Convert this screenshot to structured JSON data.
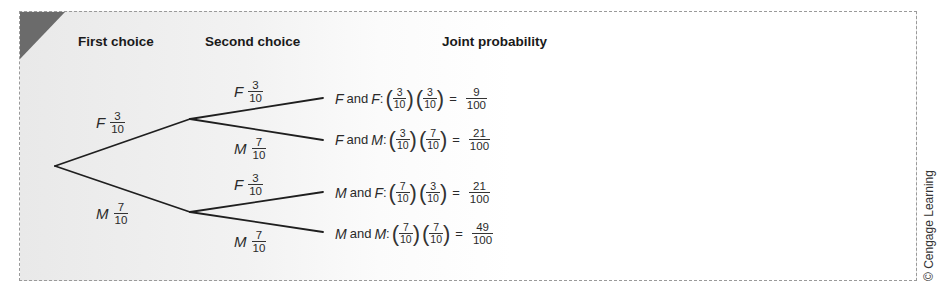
{
  "header_clipped_title": "Tree Diagram with Joint Probabilities",
  "columns": {
    "first": "First choice",
    "second": "Second choice",
    "joint": "Joint probability"
  },
  "first_choice": [
    {
      "var": "F",
      "num": "3",
      "den": "10"
    },
    {
      "var": "M",
      "num": "7",
      "den": "10"
    }
  ],
  "second_choice": [
    {
      "var": "F",
      "num": "3",
      "den": "10"
    },
    {
      "var": "M",
      "num": "7",
      "den": "10"
    },
    {
      "var": "F",
      "num": "3",
      "den": "10"
    },
    {
      "var": "M",
      "num": "7",
      "den": "10"
    }
  ],
  "outcomes": [
    {
      "a": "F",
      "and": "and",
      "b": "F",
      "p1n": "3",
      "p1d": "10",
      "p2n": "3",
      "p2d": "10",
      "eq": "=",
      "rn": "9",
      "rd": "100"
    },
    {
      "a": "F",
      "and": "and",
      "b": "M",
      "p1n": "3",
      "p1d": "10",
      "p2n": "7",
      "p2d": "10",
      "eq": "=",
      "rn": "21",
      "rd": "100"
    },
    {
      "a": "M",
      "and": "and",
      "b": "F",
      "p1n": "7",
      "p1d": "10",
      "p2n": "3",
      "p2d": "10",
      "eq": "=",
      "rn": "21",
      "rd": "100"
    },
    {
      "a": "M",
      "and": "and",
      "b": "M",
      "p1n": "7",
      "p1d": "10",
      "p2n": "7",
      "p2d": "10",
      "eq": "=",
      "rn": "49",
      "rd": "100"
    }
  ],
  "copyright": "© Cengage Learning",
  "colors": {
    "line": "#1f1f1f",
    "corner": "#6b6b6b",
    "frame_border": "#9a9a9a"
  },
  "tree_geometry": {
    "root": [
      55,
      166
    ],
    "upper_node": [
      190,
      119
    ],
    "lower_node": [
      190,
      212
    ],
    "leaves": [
      [
        323,
        98
      ],
      [
        323,
        140
      ],
      [
        323,
        192
      ],
      [
        323,
        232
      ]
    ]
  }
}
